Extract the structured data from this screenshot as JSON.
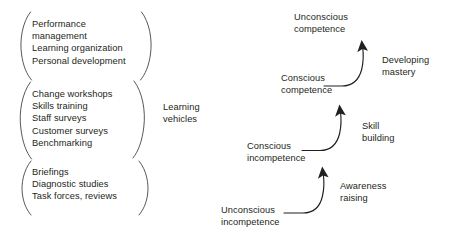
{
  "diagram": {
    "ink_color": "#231f20",
    "background_color": "#ffffff"
  },
  "left_panel": {
    "bracket_label": "Learning\nvehicles",
    "groups": [
      {
        "name": "strategic-learning-vehicles",
        "items": "Performance\nmanagement\nLearning organization\nPersonal development"
      },
      {
        "name": "operational-learning-vehicles",
        "items": "Change workshops\nSkills training\nStaff surveys\nCustomer surveys\nBenchmarking"
      },
      {
        "name": "informational-learning-vehicles",
        "items": "Briefings\nDiagnostic studies\nTask forces, reviews"
      }
    ]
  },
  "ladder": {
    "stages": [
      {
        "id": "unconscious-incompetence",
        "label": "Unconscious\nincompetence",
        "level": 1
      },
      {
        "id": "conscious-incompetence",
        "label": "Conscious\nincompetence",
        "level": 2
      },
      {
        "id": "conscious-competence",
        "label": "Conscious\ncompetence",
        "level": 3
      },
      {
        "id": "unconscious-competence",
        "label": "Unconscious\ncompetence",
        "level": 4
      }
    ],
    "transitions": [
      {
        "id": "awareness-raising",
        "label": "Awareness\nraising",
        "from": "unconscious-incompetence",
        "to": "conscious-incompetence"
      },
      {
        "id": "skill-building",
        "label": "Skill\nbuilding",
        "from": "conscious-incompetence",
        "to": "conscious-competence"
      },
      {
        "id": "developing-mastery",
        "label": "Developing\nmastery",
        "from": "conscious-competence",
        "to": "unconscious-competence"
      }
    ]
  }
}
